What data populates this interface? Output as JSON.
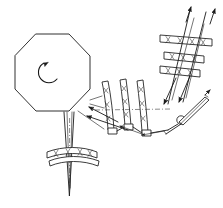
{
  "figure": {
    "background_color": "#ffffff",
    "ink_color": "#1a1a1a",
    "width": 223,
    "height": 208
  },
  "parts": {
    "octagon": {
      "name": "octagonal rotor body",
      "center": [
        52,
        72
      ],
      "radius": 40,
      "points": "36,34 69,34 90,56 90,89 69,111 36,111 15,89 15,56"
    },
    "rotation_arrow": {
      "name": "counterclockwise rotation arrow",
      "center": [
        50,
        72
      ],
      "radius": 10,
      "direction": "counterclockwise"
    },
    "blades": [
      {
        "name": "blade-1",
        "x": 104,
        "top": 80,
        "bottom": 131,
        "hatch_marks": 3
      },
      {
        "name": "blade-2",
        "x": 122,
        "top": 78,
        "bottom": 127,
        "hatch_marks": 3
      },
      {
        "name": "blade-3",
        "x": 139,
        "top": 79,
        "bottom": 133,
        "hatch_marks": 3
      }
    ],
    "ladder_bars": [
      {
        "name": "ladder-bar-upper",
        "x1": 161,
        "y1": 37,
        "x2": 212,
        "y2": 43,
        "hatch_marks": 4
      },
      {
        "name": "ladder-bar-middle",
        "x1": 165,
        "y1": 54,
        "x2": 203,
        "y2": 58,
        "hatch_marks": 4
      },
      {
        "name": "ladder-bar-lower",
        "x1": 161,
        "y1": 68,
        "x2": 199,
        "y2": 72,
        "hatch_marks": 4
      }
    ],
    "arc_bars": [
      {
        "name": "arc-bar-upper",
        "hatch_marks": 4
      },
      {
        "name": "arc-bar-lower",
        "hatch_marks": 0
      }
    ],
    "spindle": {
      "name": "tapered spindle",
      "top": [
        70,
        112
      ],
      "tip": [
        70,
        196
      ]
    },
    "pivot": {
      "name": "pivot joint",
      "center": [
        181,
        120
      ],
      "radius": 4
    },
    "lever": {
      "name": "pivot lever arm",
      "from": [
        181,
        120
      ],
      "to": [
        207,
        99
      ]
    },
    "centerline": {
      "name": "horizontal centerline",
      "from": [
        95,
        110
      ],
      "to": [
        170,
        110
      ]
    },
    "arrows": [
      {
        "name": "flow-arrow-up-right-a",
        "tip": [
          192,
          5
        ]
      },
      {
        "name": "flow-arrow-up-right-b",
        "tip": [
          215,
          7
        ]
      },
      {
        "name": "flow-arrow-down-left-a",
        "tip": [
          165,
          103
        ]
      },
      {
        "name": "flow-arrow-down-left-b",
        "tip": [
          180,
          101
        ]
      },
      {
        "name": "flow-arrow-left-a",
        "tip": [
          90,
          108
        ]
      },
      {
        "name": "flow-arrow-left-b",
        "tip": [
          88,
          117
        ]
      },
      {
        "name": "lever-tip-arrow",
        "tip": [
          209,
          92
        ]
      }
    ]
  }
}
